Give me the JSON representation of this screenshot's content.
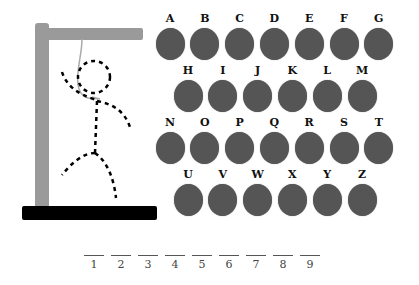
{
  "game": "Hangman",
  "colors": {
    "gallows": "#9a9a9a",
    "base": "#000000",
    "key": "#555555",
    "figure": "#000000"
  },
  "keyboard": {
    "rows": [
      [
        "A",
        "B",
        "C",
        "D",
        "E",
        "F",
        "G"
      ],
      [
        "H",
        "I",
        "J",
        "K",
        "L",
        "M"
      ],
      [
        "N",
        "O",
        "P",
        "Q",
        "R",
        "S",
        "T"
      ],
      [
        "U",
        "V",
        "W",
        "X",
        "Y",
        "Z"
      ]
    ]
  },
  "word_slots": [
    "1",
    "2",
    "3",
    "4",
    "5",
    "6",
    "7",
    "8",
    "9"
  ]
}
